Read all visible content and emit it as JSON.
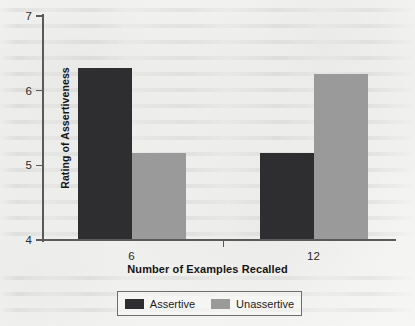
{
  "chart_data": {
    "type": "bar",
    "title": "",
    "subtitle": "",
    "xlabel": "Number of Examples Recalled",
    "ylabel": "Rating of Assertiveness",
    "categories": [
      "6",
      "12"
    ],
    "series": [
      {
        "name": "Assertive",
        "values": [
          6.3,
          5.17
        ],
        "color": "#2e2e30"
      },
      {
        "name": "Unassertive",
        "values": [
          5.16,
          6.22
        ],
        "color": "#9a9a9a"
      }
    ],
    "ylim": [
      4,
      7
    ],
    "yticks": [
      4,
      5,
      6,
      7
    ],
    "ytick_labels": [
      "4",
      "5",
      "6",
      "7"
    ],
    "grid": false,
    "legend_position": "bottom"
  },
  "legend": {
    "items": [
      {
        "label": "Assertive",
        "color": "#2e2e30"
      },
      {
        "label": "Unassertive",
        "color": "#9a9a9a"
      }
    ]
  }
}
